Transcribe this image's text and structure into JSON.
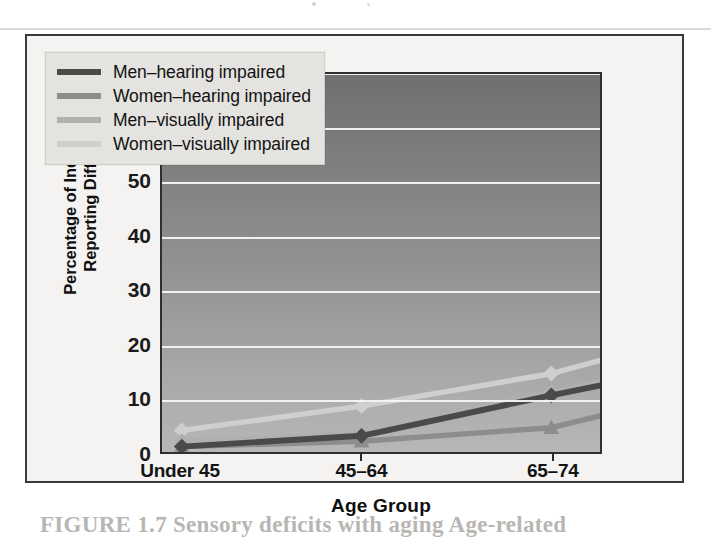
{
  "figure": {
    "caption_partial": "FIGURE 1.7 Sensory deficits with aging Age-related",
    "background_color": "#f4f3f1",
    "frame_color": "#3a3a3a"
  },
  "axes": {
    "y_title": "Percentage of Individuals Reporting Difficulty",
    "x_title": "Age Group",
    "y_ticks": [
      "0",
      "10",
      "20",
      "30",
      "40",
      "50",
      "60",
      "70"
    ],
    "x_ticks": [
      "Under 45",
      "45–64",
      "65–74",
      "75–84",
      "85+"
    ]
  },
  "legend": {
    "items": [
      {
        "label": "Men–hearing impaired",
        "color": "#4a4a4a"
      },
      {
        "label": "Women–hearing impaired",
        "color": "#8d8d8d"
      },
      {
        "label": "Men–visually impaired",
        "color": "#b0b0b0"
      },
      {
        "label": "Women–visually impaired",
        "color": "#cfcfcf"
      }
    ]
  },
  "chart_data": {
    "type": "line",
    "title": "",
    "subtitle": "",
    "xlabel": "Age Group",
    "ylabel": "Percentage of Individuals Reporting Difficulty",
    "categories": [
      "Under 45",
      "45–64",
      "65–74",
      "75–84",
      "85+"
    ],
    "ylim": [
      0,
      70
    ],
    "ytick_step": 10,
    "grid": true,
    "grid_orientation": "horizontal",
    "legend_position": "top-left-inside",
    "series": [
      {
        "name": "Men–hearing impaired",
        "color": "#4a4a4a",
        "marker": "diamond",
        "values": [
          1,
          3,
          10.5,
          17.5,
          59
        ]
      },
      {
        "name": "Women–hearing impaired",
        "color": "#8d8d8d",
        "marker": "triangle",
        "values": [
          1,
          2,
          4.5,
          13,
          27.5
        ]
      },
      {
        "name": "Men–visually impaired",
        "color": "#b0b0b0",
        "marker": "diamond",
        "values": [
          2,
          3.5,
          11,
          18.5,
          50
        ]
      },
      {
        "name": "Women–visually impaired",
        "color": "#cfcfcf",
        "marker": "diamond",
        "values": [
          4,
          8.5,
          14.5,
          24,
          35
        ]
      }
    ]
  }
}
